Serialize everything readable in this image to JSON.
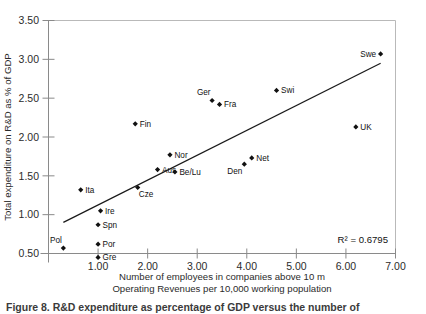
{
  "chart_data": {
    "type": "scatter",
    "title": "",
    "xlabel": "Number of employees in companies above 10 m Operating Revenues per 10,000 working population",
    "xlabel_line1": "Number of employees in companies above 10 m",
    "xlabel_line2": "Operating Revenues per 10,000 working population",
    "ylabel": "Total expenditure on R&D as % of GDP",
    "xlim": [
      0,
      7
    ],
    "ylim": [
      0.5,
      3.5
    ],
    "xticks": [
      0,
      1,
      2,
      3,
      4,
      5,
      6,
      7
    ],
    "xtick_labels": [
      "",
      "1.00",
      "2.00",
      "3.00",
      "4.00",
      "5.00",
      "6.00",
      "7.00"
    ],
    "yticks": [
      0.5,
      1.0,
      1.5,
      2.0,
      2.5,
      3.0,
      3.5
    ],
    "ytick_labels": [
      "0.50",
      "1.00",
      "1.50",
      "2.00",
      "2.50",
      "3.00",
      "3.50"
    ],
    "grid": false,
    "legend": null,
    "annotation": "R² = 0.6795",
    "r_squared": 0.6795,
    "trendline": {
      "type": "linear",
      "x_start": 0.3,
      "y_start": 0.9,
      "x_end": 6.7,
      "y_end": 2.95
    },
    "points": [
      {
        "label": "Pol",
        "x": 0.3,
        "y": 0.57,
        "label_pos": "above-left"
      },
      {
        "label": "Ita",
        "x": 0.65,
        "y": 1.32,
        "label_pos": "right"
      },
      {
        "label": "Gre",
        "x": 1.0,
        "y": 0.45,
        "label_pos": "right"
      },
      {
        "label": "Por",
        "x": 1.0,
        "y": 0.62,
        "label_pos": "right"
      },
      {
        "label": "Spn",
        "x": 1.0,
        "y": 0.87,
        "label_pos": "right"
      },
      {
        "label": "Ire",
        "x": 1.05,
        "y": 1.05,
        "label_pos": "right"
      },
      {
        "label": "Fin",
        "x": 1.75,
        "y": 2.17,
        "label_pos": "right"
      },
      {
        "label": "Cze",
        "x": 1.8,
        "y": 1.35,
        "label_pos": "below-right"
      },
      {
        "label": "Aus",
        "x": 2.2,
        "y": 1.58,
        "label_pos": "right"
      },
      {
        "label": "Nor",
        "x": 2.45,
        "y": 1.77,
        "label_pos": "right"
      },
      {
        "label": "Be/Lu",
        "x": 2.55,
        "y": 1.55,
        "label_pos": "right"
      },
      {
        "label": "Ger",
        "x": 3.3,
        "y": 2.47,
        "label_pos": "above-left"
      },
      {
        "label": "Fra",
        "x": 3.45,
        "y": 2.42,
        "label_pos": "right"
      },
      {
        "label": "Den",
        "x": 3.95,
        "y": 1.65,
        "label_pos": "below-left"
      },
      {
        "label": "Net",
        "x": 4.1,
        "y": 1.73,
        "label_pos": "right"
      },
      {
        "label": "Swi",
        "x": 4.6,
        "y": 2.6,
        "label_pos": "right"
      },
      {
        "label": "UK",
        "x": 6.2,
        "y": 2.13,
        "label_pos": "right"
      },
      {
        "label": "Swe",
        "x": 6.7,
        "y": 3.07,
        "label_pos": "left"
      }
    ]
  },
  "caption": {
    "text": "Figure 8. R&D expenditure as percentage of GDP versus the number of"
  }
}
